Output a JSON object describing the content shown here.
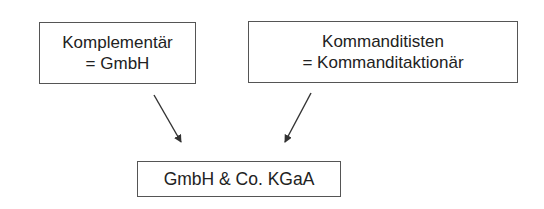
{
  "diagram": {
    "nodes": [
      {
        "id": "komplementaer",
        "line1": "Komplementär",
        "line2": "= GmbH"
      },
      {
        "id": "kommanditisten",
        "line1": "Kommanditisten",
        "line2": "= Kommanditaktionär"
      },
      {
        "id": "result",
        "label": "GmbH & Co. KGaA"
      }
    ],
    "edges": [
      {
        "from": "komplementaer",
        "to": "result"
      },
      {
        "from": "kommanditisten",
        "to": "result"
      }
    ],
    "colors": {
      "border": "#555555",
      "text": "#222222",
      "arrow": "#333333",
      "background": "#ffffff"
    }
  }
}
